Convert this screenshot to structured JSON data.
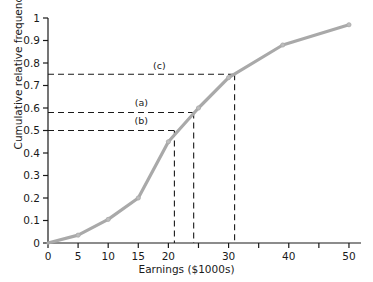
{
  "chart_data": {
    "type": "line",
    "title": "",
    "xlabel": "Earnings ($1000s)",
    "ylabel": "Cumulative relative frequency",
    "xlim": [
      0,
      52
    ],
    "ylim": [
      0,
      1
    ],
    "grid": false,
    "legend": "none",
    "series": [
      {
        "name": "Cumulative relative frequency",
        "color": "#a9a9a9",
        "marker": "circle",
        "x": [
          0,
          5,
          10,
          15,
          20,
          25,
          30,
          39,
          50
        ],
        "values": [
          0.0,
          0.035,
          0.105,
          0.2,
          0.45,
          0.6,
          0.735,
          0.88,
          0.97
        ]
      }
    ],
    "xticks": [
      0,
      5,
      10,
      15,
      20,
      25,
      30,
      35,
      40,
      45,
      50
    ],
    "xtick_labels": [
      "0",
      "5",
      "10",
      "15",
      "20",
      "",
      "30",
      "",
      "40",
      "",
      "50"
    ],
    "yticks": [
      0,
      0.1,
      0.2,
      0.3,
      0.4,
      0.5,
      0.6,
      0.7,
      0.8,
      0.9,
      1
    ],
    "ytick_labels": [
      "0",
      "0.1",
      "0.2",
      "0.3",
      "0.4",
      "0.5",
      "0.6",
      "0.7",
      "0.8",
      "0.9",
      "1"
    ],
    "annotations": [
      {
        "label": "(c)",
        "y": 0.75,
        "x": 31.0,
        "label_x": 18.5,
        "label_y": 0.79
      },
      {
        "label": "(a)",
        "y": 0.58,
        "x": 24.2,
        "label_x": 15.5,
        "label_y": 0.625
      },
      {
        "label": "(b)",
        "y": 0.5,
        "x": 21.0,
        "label_x": 15.5,
        "label_y": 0.545
      }
    ]
  },
  "axis": {
    "x_title": "Earnings ($1000s)",
    "y_title": "Cumulative relative frequency"
  },
  "colors": {
    "line": "#a9a9a9",
    "axis": "#1a1a1a",
    "dash": "#1a1a1a",
    "background": "#ffffff"
  }
}
